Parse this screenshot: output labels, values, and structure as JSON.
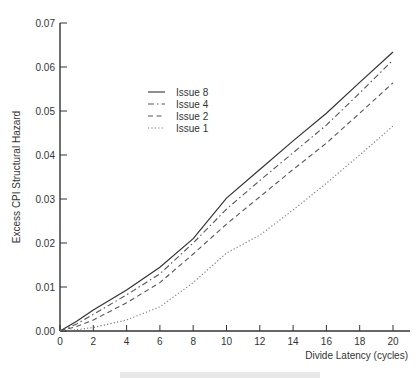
{
  "chart_data": {
    "type": "line",
    "title": "",
    "xlabel": "Divide Latency (cycles)",
    "ylabel": "Excess CPI Structural Hazard",
    "xlim": [
      0,
      21
    ],
    "ylim": [
      0,
      0.07
    ],
    "x_ticks": [
      "0",
      "2",
      "4",
      "6",
      "8",
      "10",
      "12",
      "14",
      "16",
      "18",
      "20"
    ],
    "y_ticks": [
      "0.00",
      "0.01",
      "0.02",
      "0.03",
      "0.04",
      "0.05",
      "0.06",
      "0.07"
    ],
    "grid": false,
    "legend_position": "upper-left-inside",
    "x": [
      0,
      1,
      2,
      4,
      6,
      8,
      10,
      12,
      14,
      16,
      18,
      20
    ],
    "series": [
      {
        "name": "Issue 8",
        "style": "solid",
        "values": [
          0,
          0.0022,
          0.0048,
          0.0093,
          0.0145,
          0.021,
          0.0302,
          0.0367,
          0.0432,
          0.0495,
          0.0565,
          0.0634
        ]
      },
      {
        "name": "Issue 4",
        "style": "dashdot",
        "values": [
          0,
          0.0016,
          0.0038,
          0.0082,
          0.013,
          0.02,
          0.0277,
          0.0342,
          0.0405,
          0.0468,
          0.0541,
          0.0616
        ]
      },
      {
        "name": "Issue 2",
        "style": "dashed",
        "values": [
          0,
          0.001,
          0.0025,
          0.0064,
          0.011,
          0.0175,
          0.0243,
          0.0305,
          0.0367,
          0.0427,
          0.0495,
          0.0564
        ]
      },
      {
        "name": "Issue 1",
        "style": "dotted",
        "values": [
          0,
          0.0003,
          0.0008,
          0.0025,
          0.0055,
          0.011,
          0.0177,
          0.0218,
          0.0275,
          0.0336,
          0.04,
          0.0466
        ]
      }
    ]
  },
  "caption": ""
}
